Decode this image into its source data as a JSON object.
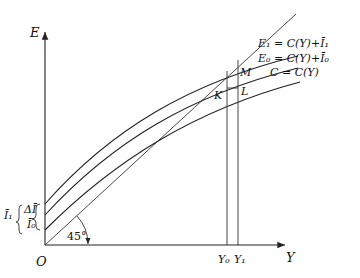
{
  "diagram": {
    "title": "",
    "axes": {
      "vertical_label": "E",
      "horizontal_label": "Y",
      "origin_label": "O"
    },
    "curves": [
      {
        "id": "E1",
        "label": "E₁ = C(Y)+Ī₁"
      },
      {
        "id": "E0",
        "label": "E₀ = C(Y)+Ī₀"
      },
      {
        "id": "C",
        "label": "C = C(Y)"
      }
    ],
    "reference_line": {
      "label": "45°"
    },
    "points": {
      "K": "K",
      "L": "L",
      "M": "M"
    },
    "x_markers": {
      "Y0": "Y₀",
      "Y1": "Y₁"
    },
    "intercepts": {
      "I1": "Ī₁",
      "delta_I": "ΔĪ",
      "I0": "Ī₀"
    }
  }
}
